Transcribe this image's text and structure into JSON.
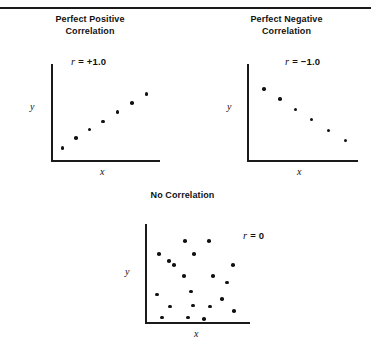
{
  "figure": {
    "background_color": "#ffffff",
    "ink_color": "#111111",
    "top_rule": true
  },
  "chart_data": [
    {
      "type": "scatter",
      "title": "Perfect Positive\nCorrelation",
      "title_lines": [
        "Perfect Positive",
        "Correlation"
      ],
      "annotation": "r = +1.0",
      "r_symbol": "r",
      "r_value": "= +1.0",
      "xlabel": "x",
      "ylabel": "y",
      "grid": false,
      "legend": "none",
      "axis": {
        "x_range": [
          0,
          1
        ],
        "y_range": [
          0,
          1
        ]
      },
      "points": [
        {
          "x": 0.09,
          "y": 0.13
        },
        {
          "x": 0.22,
          "y": 0.24
        },
        {
          "x": 0.35,
          "y": 0.33
        },
        {
          "x": 0.48,
          "y": 0.42
        },
        {
          "x": 0.62,
          "y": 0.52
        },
        {
          "x": 0.76,
          "y": 0.62
        },
        {
          "x": 0.9,
          "y": 0.72
        }
      ],
      "n_points": 7
    },
    {
      "type": "scatter",
      "title": "Perfect Negative\nCorrelation",
      "title_lines": [
        "Perfect Negative",
        "Correlation"
      ],
      "annotation": "r = −1.0",
      "r_symbol": "r",
      "r_value": "= −1.0",
      "xlabel": "x",
      "ylabel": "y",
      "grid": false,
      "legend": "none",
      "axis": {
        "x_range": [
          0,
          1
        ],
        "y_range": [
          0,
          1
        ]
      },
      "points": [
        {
          "x": 0.14,
          "y": 0.77
        },
        {
          "x": 0.29,
          "y": 0.66
        },
        {
          "x": 0.44,
          "y": 0.55
        },
        {
          "x": 0.59,
          "y": 0.44
        },
        {
          "x": 0.75,
          "y": 0.32
        },
        {
          "x": 0.91,
          "y": 0.21
        }
      ],
      "n_points": 6
    },
    {
      "type": "scatter",
      "title": "No Correlation",
      "title_lines": [
        "No Correlation"
      ],
      "annotation": "r = 0",
      "r_symbol": "r",
      "r_value": "= 0",
      "xlabel": "x",
      "ylabel": "y",
      "grid": false,
      "legend": "none",
      "axis": {
        "x_range": [
          0,
          1
        ],
        "y_range": [
          0,
          1
        ]
      },
      "points": [
        {
          "x": 0.12,
          "y": 0.74
        },
        {
          "x": 0.38,
          "y": 0.88
        },
        {
          "x": 0.62,
          "y": 0.88
        },
        {
          "x": 0.27,
          "y": 0.62
        },
        {
          "x": 0.47,
          "y": 0.74
        },
        {
          "x": 0.86,
          "y": 0.62
        },
        {
          "x": 0.22,
          "y": 0.66
        },
        {
          "x": 0.37,
          "y": 0.5
        },
        {
          "x": 0.66,
          "y": 0.5
        },
        {
          "x": 0.8,
          "y": 0.43
        },
        {
          "x": 0.44,
          "y": 0.33
        },
        {
          "x": 0.1,
          "y": 0.3
        },
        {
          "x": 0.23,
          "y": 0.17
        },
        {
          "x": 0.46,
          "y": 0.18
        },
        {
          "x": 0.63,
          "y": 0.17
        },
        {
          "x": 0.75,
          "y": 0.25
        },
        {
          "x": 0.87,
          "y": 0.12
        },
        {
          "x": 0.15,
          "y": 0.05
        },
        {
          "x": 0.41,
          "y": 0.05
        },
        {
          "x": 0.57,
          "y": 0.03
        }
      ],
      "n_points": 20
    }
  ]
}
